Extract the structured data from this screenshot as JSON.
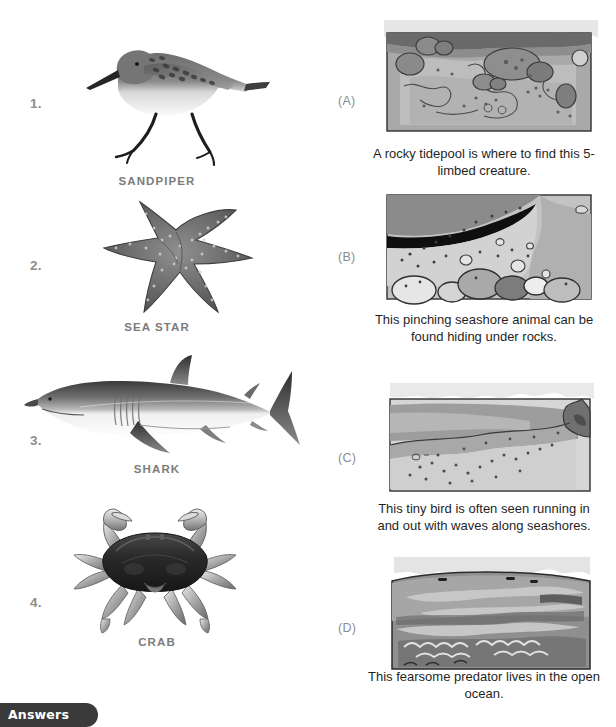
{
  "worksheet": {
    "left_column_title": "",
    "items": [
      {
        "number": "1.",
        "label": "SANDPIPER",
        "art": "sandpiper-illustration"
      },
      {
        "number": "2.",
        "label": "SEA STAR",
        "art": "sea-star-illustration"
      },
      {
        "number": "3.",
        "label": "SHARK",
        "art": "shark-illustration"
      },
      {
        "number": "4.",
        "label": "CRAB",
        "art": "crab-illustration"
      }
    ],
    "choices": [
      {
        "letter": "(A)",
        "image": "rocky-tidepool-scene",
        "caption": "A rocky tidepool is where to find this 5-limbed creature."
      },
      {
        "letter": "(B)",
        "image": "rock-crevice-scene",
        "caption": "This pinching seashore animal can be found hiding under rocks."
      },
      {
        "letter": "(C)",
        "image": "sandy-shoreline-scene",
        "caption": "This tiny bird is often seen running in and out with waves along seashores."
      },
      {
        "letter": "(D)",
        "image": "open-ocean-scene",
        "caption": "This fearsome predator lives in the open ocean."
      }
    ],
    "answers_tab": {
      "label": "Answers"
    }
  },
  "colors": {
    "number_grey": "#8d8d8d",
    "label_grey": "#7c7c7c",
    "caption_black": "#1f1f1f",
    "tab_dark": "#3a3a3a",
    "paper_white": "#ffffff"
  }
}
